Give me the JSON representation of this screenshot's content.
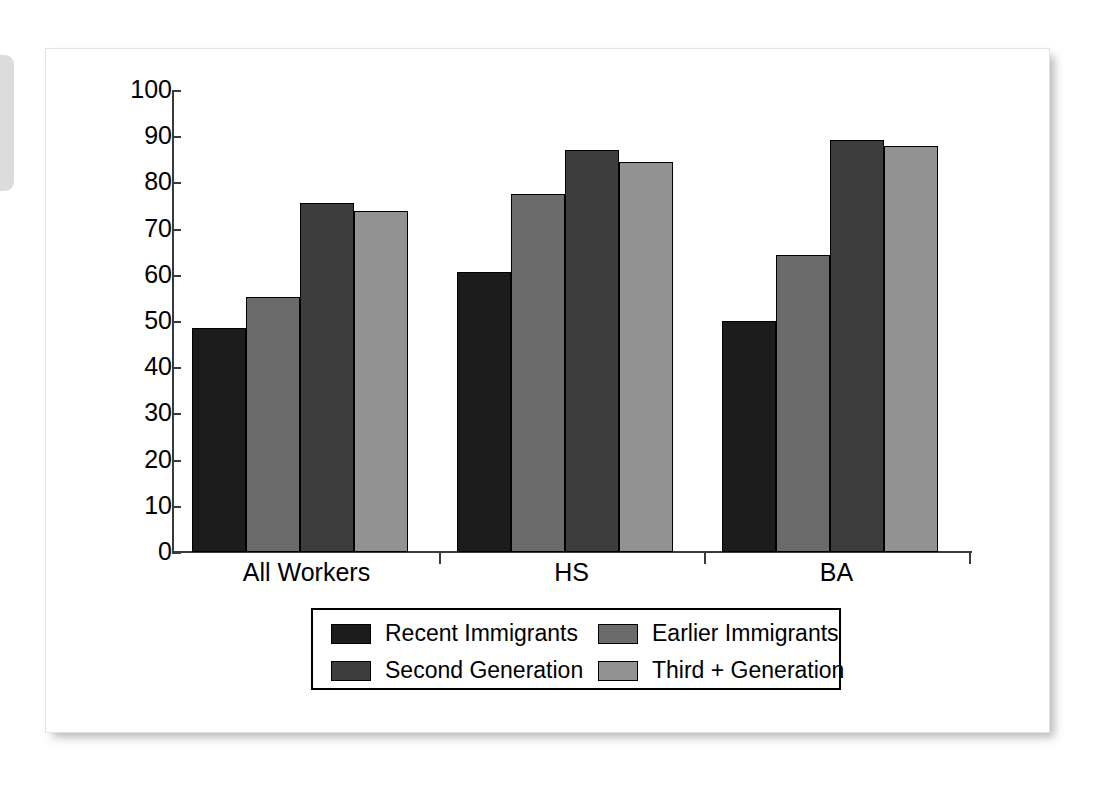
{
  "chart_data": {
    "type": "bar",
    "title": "",
    "subtitle": "",
    "xlabel": "",
    "ylabel": "",
    "ylim": [
      0,
      100
    ],
    "yticks": [
      "0",
      "10",
      "20",
      "30",
      "40",
      "50",
      "60",
      "70",
      "80",
      "90",
      "100"
    ],
    "grid": false,
    "legend_position": "bottom-center",
    "categories": [
      "All Workers",
      "HS",
      "BA"
    ],
    "series": [
      {
        "name": "Recent Immigrants",
        "color": "#1c1c1c",
        "values": [
          48.5,
          60.5,
          50.0
        ]
      },
      {
        "name": "Earlier Immigrants",
        "color": "#6b6b6b",
        "values": [
          55.3,
          77.5,
          64.3
        ]
      },
      {
        "name": "Second Generation",
        "color": "#3d3d3d",
        "values": [
          75.5,
          87.0,
          89.2
        ]
      },
      {
        "name": "Third + Generation",
        "color": "#929292",
        "values": [
          73.8,
          84.5,
          87.8
        ]
      }
    ]
  },
  "legend": {
    "entries": [
      {
        "label": "Recent Immigrants",
        "color": "#1c1c1c"
      },
      {
        "label": "Earlier Immigrants",
        "color": "#6b6b6b"
      },
      {
        "label": "Second Generation",
        "color": "#3d3d3d"
      },
      {
        "label": "Third + Generation",
        "color": "#929292"
      }
    ]
  },
  "axis": {
    "y_labels": [
      "100",
      "90",
      "80",
      "70",
      "60",
      "50",
      "40",
      "30",
      "20",
      "10",
      "0"
    ],
    "x_labels": [
      "All Workers",
      "HS",
      "BA"
    ]
  },
  "colors": {
    "axis": "#3a3a3a",
    "text": "#000000",
    "card_background": "#ffffff",
    "side_tab": "#dcdcdc"
  }
}
